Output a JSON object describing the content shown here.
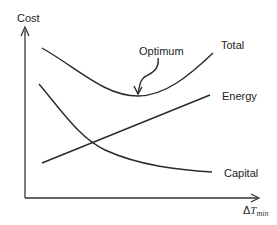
{
  "diagram": {
    "type": "cost vs minimum temperature difference trade-off",
    "y_axis_label": "Cost",
    "x_axis_label": {
      "delta": "Δ",
      "symbol": "T",
      "subscript": "min"
    },
    "curves": [
      {
        "name": "Total",
        "shape": "U-shaped"
      },
      {
        "name": "Energy",
        "shape": "increasing linear"
      },
      {
        "name": "Capital",
        "shape": "decreasing convex"
      }
    ],
    "annotation": {
      "label": "Optimum",
      "points_to": "minimum of Total curve"
    },
    "line_color": "#2a2a2a"
  }
}
